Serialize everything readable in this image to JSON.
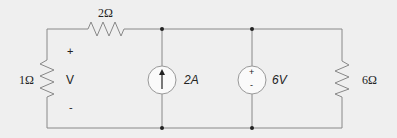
{
  "diagram": {
    "type": "electric-circuit",
    "background": "#efefef",
    "wire_color": "#888888",
    "components": {
      "r_top": {
        "label": "2Ω",
        "value_ohms": 2,
        "position": "top branch, left"
      },
      "r_left": {
        "label": "1Ω",
        "value_ohms": 1,
        "position": "left branch"
      },
      "r_right": {
        "label": "6Ω",
        "value_ohms": 6,
        "position": "right branch"
      },
      "current_source": {
        "label": "2A",
        "value_amps": 2,
        "direction": "up"
      },
      "voltage_source": {
        "label": "6V",
        "value_volts": 6,
        "plus": "+",
        "minus": "-"
      }
    },
    "voltage_marker": {
      "label": "V",
      "plus": "+",
      "minus": "-"
    }
  }
}
